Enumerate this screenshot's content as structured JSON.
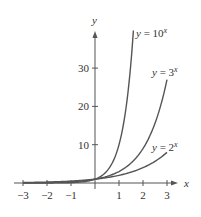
{
  "chart_data": {
    "type": "line",
    "title": "",
    "xlabel": "x",
    "ylabel": "y",
    "xlim": [
      -3.3,
      3.4
    ],
    "ylim": [
      -1,
      40
    ],
    "grid": false,
    "x_ticks": [
      -3,
      -2,
      -1,
      1,
      2,
      3
    ],
    "x_tick_labels": [
      "−3",
      "−2",
      "−1",
      "1",
      "2",
      "3"
    ],
    "y_ticks": [
      10,
      20,
      30
    ],
    "y_tick_labels": [
      "10",
      "20",
      "30"
    ],
    "series": [
      {
        "name": "y = 10^x",
        "label": "y = 10",
        "exp": "x",
        "base": 10,
        "x_range": [
          -3,
          1.6
        ]
      },
      {
        "name": "y = 3^x",
        "label": "y = 3",
        "exp": "x",
        "base": 3,
        "x_range": [
          -3,
          3
        ]
      },
      {
        "name": "y = 2^x",
        "label": "y = 2",
        "exp": "x",
        "base": 2,
        "x_range": [
          -3,
          3
        ]
      }
    ],
    "annotations": [
      "y = 10^x",
      "y = 3^x",
      "y = 2^x"
    ],
    "line_color": "#555555"
  }
}
